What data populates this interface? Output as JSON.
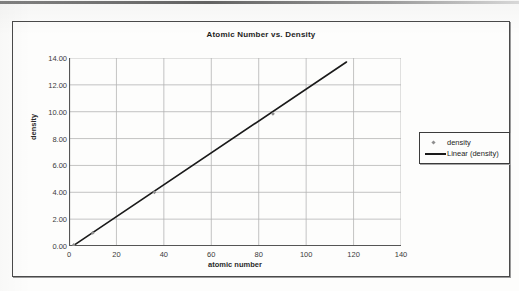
{
  "chart_data": {
    "type": "scatter",
    "title": "Atomic Number vs. Density",
    "xlabel": "atomic number",
    "ylabel": "density",
    "xlim": [
      0,
      140
    ],
    "ylim": [
      0,
      14
    ],
    "xticks": [
      "0",
      "20",
      "40",
      "60",
      "80",
      "100",
      "120",
      "140"
    ],
    "xtick_values": [
      0,
      20,
      40,
      60,
      80,
      100,
      120,
      140
    ],
    "yticks": [
      "0.00",
      "2.00",
      "4.00",
      "6.00",
      "8.00",
      "10.00",
      "12.00",
      "14.00"
    ],
    "ytick_values": [
      0,
      2,
      4,
      6,
      8,
      10,
      12,
      14
    ],
    "grid": true,
    "legend_position": "right",
    "series": [
      {
        "name": "density",
        "kind": "scatter",
        "marker": "diamond",
        "color": "#8e8e8e",
        "points": [
          {
            "x": 2,
            "y": 0.08
          },
          {
            "x": 10,
            "y": 0.97
          },
          {
            "x": 36,
            "y": 4.0
          },
          {
            "x": 86,
            "y": 9.84
          }
        ]
      },
      {
        "name": "Linear (density)",
        "kind": "trendline",
        "color": "#1a1a1a",
        "x_start": 2,
        "y_start": 0.05,
        "x_end": 117,
        "y_end": 13.7,
        "slope": 0.1187,
        "intercept": -0.19
      }
    ],
    "legend": [
      "density",
      "Linear (density)"
    ]
  },
  "colors": {
    "grid": "#b4b4b4",
    "axis": "#555555",
    "trendline": "#1a1a1a",
    "marker": "#8e8e8e",
    "frame": "#4a4a4a",
    "text": "#2a2a2a",
    "background": "#fdfdfc"
  }
}
